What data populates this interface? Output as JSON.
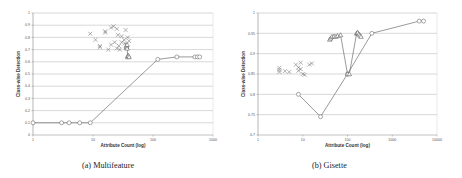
{
  "figure": {
    "captions": [
      "(a)  Multifeature",
      "(b)  Gisette"
    ]
  },
  "chart_data": [
    {
      "type": "scatter",
      "title": "",
      "caption": "(a)  Multifeature",
      "xlabel": "Attribute Count (log)",
      "ylabel": "Class-wise Detection",
      "xscale": "log",
      "xlim": [
        1,
        1000
      ],
      "ylim": [
        0,
        1
      ],
      "xticks": [
        1,
        10,
        100,
        1000
      ],
      "xtick_labels": [
        "1",
        "10",
        "100",
        "1000"
      ],
      "yticks": [
        0,
        0.1,
        0.2,
        0.3,
        0.4,
        0.5,
        0.6,
        0.7,
        0.8,
        0.9,
        1
      ],
      "ytick_labels": [
        "0",
        "0.1",
        "0.2",
        "0.3",
        "0.4",
        "0.5",
        "0.6",
        "0.7",
        "0.8",
        "0.9",
        "1"
      ],
      "grid": true,
      "series": [
        {
          "name": "circles",
          "marker": "circle",
          "connected": true,
          "x": [
            1,
            3,
            4,
            6,
            9,
            120,
            250,
            500,
            550,
            600
          ],
          "y": [
            0.1,
            0.1,
            0.1,
            0.1,
            0.1,
            0.62,
            0.64,
            0.64,
            0.64,
            0.64
          ]
        },
        {
          "name": "crosses",
          "marker": "x",
          "connected": false,
          "x": [
            9,
            11,
            13,
            16,
            16,
            18,
            20,
            22,
            23,
            25,
            25,
            27,
            28,
            30,
            30,
            33,
            35,
            36,
            38,
            40,
            13,
            20,
            26,
            34,
            37
          ],
          "y": [
            0.83,
            0.78,
            0.73,
            0.85,
            0.84,
            0.7,
            0.88,
            0.89,
            0.76,
            0.87,
            0.71,
            0.73,
            0.7,
            0.81,
            0.76,
            0.78,
            0.86,
            0.74,
            0.8,
            0.77,
            0.72,
            0.74,
            0.82,
            0.75,
            0.72
          ]
        },
        {
          "name": "triangles",
          "marker": "triangle",
          "connected": true,
          "x": [
            36,
            36,
            37,
            37,
            38,
            38,
            39,
            40
          ],
          "y": [
            0.72,
            0.73,
            0.74,
            0.71,
            0.65,
            0.64,
            0.65,
            0.64
          ]
        }
      ]
    },
    {
      "type": "scatter",
      "title": "",
      "caption": "(b)  Gisette",
      "xlabel": "Attribute Count (log)",
      "ylabel": "Class-wise Detection",
      "xscale": "log",
      "xlim": [
        1,
        10000
      ],
      "ylim": [
        0.7,
        1
      ],
      "xticks": [
        1,
        10,
        100,
        1000,
        10000
      ],
      "xtick_labels": [
        "1",
        "10",
        "100",
        "1000",
        "10000"
      ],
      "yticks": [
        0.7,
        0.75,
        0.8,
        0.85,
        0.9,
        0.95,
        1
      ],
      "ytick_labels": [
        "0.7",
        "0.75",
        "0.8",
        "0.85",
        "0.9",
        "0.95",
        "1"
      ],
      "grid": true,
      "series": [
        {
          "name": "circles",
          "marker": "circle",
          "connected": true,
          "x": [
            8,
            25,
            100,
            350,
            4000,
            5000
          ],
          "y": [
            0.8,
            0.745,
            0.85,
            0.95,
            0.98,
            0.98
          ]
        },
        {
          "name": "crosses",
          "marker": "x",
          "connected": false,
          "x": [
            3,
            3,
            3,
            4,
            5,
            7,
            8,
            8,
            9,
            9,
            10,
            11,
            14,
            16
          ],
          "y": [
            0.86,
            0.865,
            0.855,
            0.857,
            0.855,
            0.873,
            0.866,
            0.858,
            0.878,
            0.862,
            0.85,
            0.848,
            0.873,
            0.876
          ]
        },
        {
          "name": "triangles",
          "marker": "triangle",
          "connected": true,
          "x": [
            40,
            42,
            45,
            50,
            55,
            60,
            70,
            100,
            110,
            160,
            165,
            170,
            180,
            190,
            200
          ],
          "y": [
            0.935,
            0.938,
            0.942,
            0.943,
            0.942,
            0.944,
            0.946,
            0.85,
            0.85,
            0.95,
            0.951,
            0.952,
            0.948,
            0.945,
            0.942
          ]
        }
      ]
    }
  ]
}
